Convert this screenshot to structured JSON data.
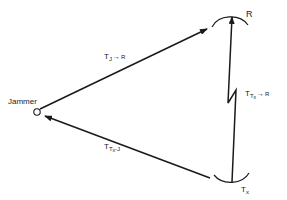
{
  "nodes": {
    "jammer": {
      "label": "Jammer"
    },
    "receiver": {
      "label": "R"
    },
    "transmitter": {
      "label": "T",
      "label_sub": "x"
    }
  },
  "edges": {
    "jammer_to_receiver": {
      "label": "T",
      "sub": "J",
      "arrow": "→",
      "target": "R"
    },
    "transmitter_to_receiver": {
      "label": "T",
      "sub": "T",
      "sub2": "x",
      "arrow": "→",
      "target": "R"
    },
    "transmitter_to_jammer": {
      "label": "T",
      "sub": "T",
      "sub2": "x",
      "suffix": "-J"
    }
  },
  "colors": {
    "stroke": "#1a1a1a",
    "background": "#ffffff"
  }
}
